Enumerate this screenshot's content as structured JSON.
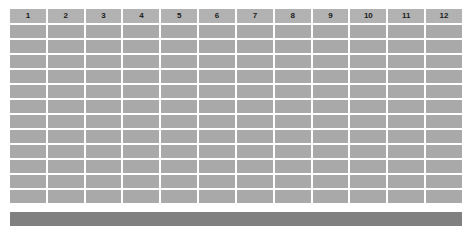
{
  "grid": {
    "column_headers": [
      "1",
      "2",
      "3",
      "4",
      "5",
      "6",
      "7",
      "8",
      "9",
      "10",
      "11",
      "12"
    ],
    "body_row_count": 12,
    "column_count": 12,
    "cells_empty": true,
    "colors": {
      "background": "#ffffff",
      "header_cell": "#b2b2b2",
      "body_cell": "#a9a9a9",
      "footer_bar": "#808080",
      "header_text": "#1a1a1a"
    }
  },
  "footer": {
    "label": ""
  }
}
